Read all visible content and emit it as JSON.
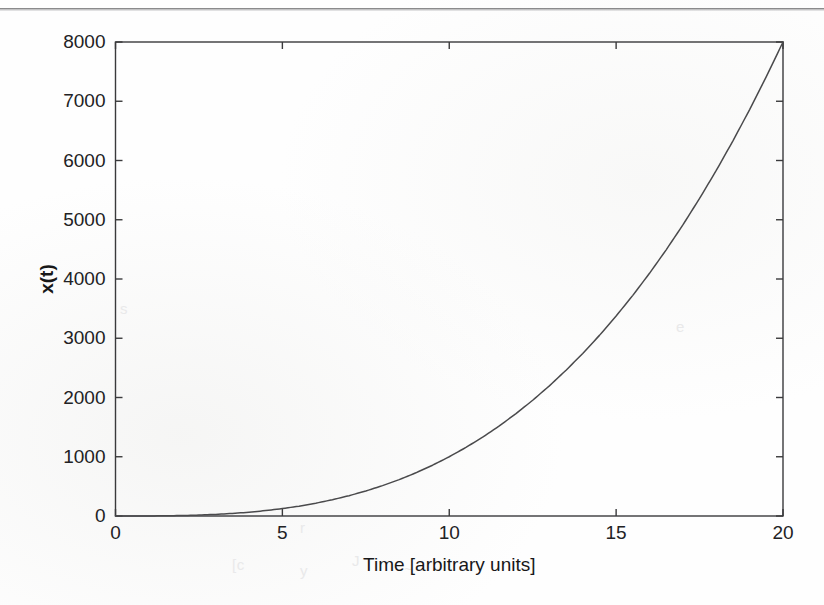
{
  "figure": {
    "background_color": "#fefefe",
    "axis_color": "#3a3a3c",
    "curve_color": "#4a4a4c",
    "text_color": "#222224"
  },
  "artifacts": {
    "scan_line_label": "scan-edge-line",
    "ghost_marks": [
      {
        "text": "[c",
        "x": 232,
        "y": 556
      },
      {
        "text": "y",
        "x": 300,
        "y": 562
      },
      {
        "text": "J",
        "x": 352,
        "y": 552
      },
      {
        "text": "~",
        "x": 404,
        "y": 560
      },
      {
        "text": "r",
        "x": 300,
        "y": 519
      },
      {
        "text": "s",
        "x": 120,
        "y": 300
      },
      {
        "text": "e",
        "x": 676,
        "y": 318
      }
    ]
  },
  "chart_data": {
    "type": "line",
    "title": "",
    "subtitle": "",
    "xlabel": "Time [arbitrary units]",
    "ylabel": "x(t)",
    "xlim": [
      0,
      20
    ],
    "ylim": [
      0,
      8000
    ],
    "xticks": [
      0,
      5,
      10,
      15,
      20
    ],
    "xtick_labels": [
      "0",
      "5",
      "10",
      "15",
      "20"
    ],
    "yticks": [
      0,
      1000,
      2000,
      3000,
      4000,
      5000,
      6000,
      7000,
      8000
    ],
    "ytick_labels": [
      "0",
      "1000",
      "2000",
      "3000",
      "4000",
      "5000",
      "6000",
      "7000",
      "8000"
    ],
    "grid": false,
    "legend": null,
    "legend_position": "none",
    "box": true,
    "tick_direction": "in",
    "annotations": [],
    "series": [
      {
        "name": "x(t)",
        "relation": "x(t) = t^3",
        "color": "#4a4a4c",
        "linewidth": 1.5,
        "x": [
          0,
          0.5,
          1,
          1.5,
          2,
          2.5,
          3,
          3.5,
          4,
          4.5,
          5,
          5.5,
          6,
          6.5,
          7,
          7.5,
          8,
          8.5,
          9,
          9.5,
          10,
          10.5,
          11,
          11.5,
          12,
          12.5,
          13,
          13.5,
          14,
          14.5,
          15,
          15.5,
          16,
          16.5,
          17,
          17.5,
          18,
          18.5,
          19,
          19.5,
          20
        ],
        "y": [
          0,
          0.125,
          1,
          3.375,
          8,
          15.625,
          27,
          42.875,
          64,
          91.125,
          125,
          166.375,
          216,
          274.625,
          343,
          421.875,
          512,
          614.125,
          729,
          857.375,
          1000,
          1157.625,
          1331,
          1520.875,
          1728,
          1953.125,
          2197,
          2460.375,
          2744,
          3048.625,
          3375,
          3723.875,
          4096,
          4492.125,
          4913,
          5359.375,
          5832,
          6331.625,
          6859,
          7414.875,
          8000
        ]
      }
    ]
  }
}
